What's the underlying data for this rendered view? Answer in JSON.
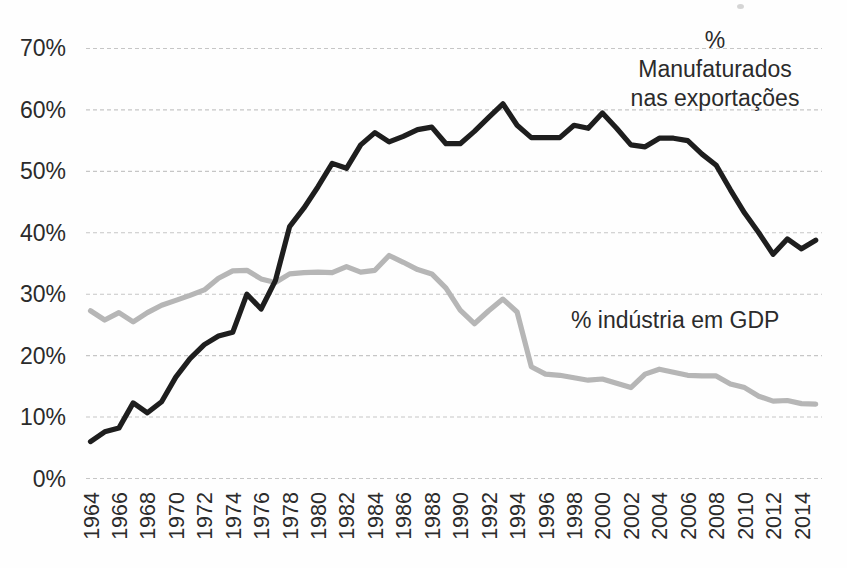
{
  "figure": {
    "background": "#fefefe",
    "grid_color": "#c6c6c6",
    "text_color": "#2b2b2b"
  },
  "chart_data": {
    "type": "line",
    "x": [
      1964,
      1965,
      1966,
      1967,
      1968,
      1969,
      1970,
      1971,
      1972,
      1973,
      1974,
      1975,
      1976,
      1977,
      1978,
      1979,
      1980,
      1981,
      1982,
      1983,
      1984,
      1985,
      1986,
      1987,
      1988,
      1989,
      1990,
      1991,
      1992,
      1993,
      1994,
      1995,
      1996,
      1997,
      1998,
      1999,
      2000,
      2001,
      2002,
      2003,
      2004,
      2005,
      2006,
      2007,
      2008,
      2009,
      2010,
      2011,
      2012,
      2013,
      2014,
      2015
    ],
    "series": [
      {
        "name": "% Manufaturados nas exportações",
        "color": "#1e1e1e",
        "values": [
          6.0,
          7.6,
          8.2,
          12.3,
          10.7,
          12.5,
          16.5,
          19.5,
          21.8,
          23.2,
          23.8,
          30.0,
          27.6,
          32.2,
          41.0,
          44.0,
          47.5,
          51.3,
          50.5,
          54.3,
          56.3,
          54.8,
          55.7,
          56.8,
          57.2,
          54.5,
          54.5,
          56.5,
          58.8,
          61.0,
          57.5,
          55.5,
          55.5,
          55.5,
          57.5,
          57.0,
          59.5,
          57.0,
          54.3,
          54.0,
          55.4,
          55.4,
          55.0,
          52.8,
          51.0,
          47.0,
          43.2,
          40.0,
          36.5,
          39.0,
          37.4,
          38.8
        ]
      },
      {
        "name": "% indústria em GDP",
        "color": "#b6b6b6",
        "values": [
          27.3,
          25.8,
          27.0,
          25.5,
          27.0,
          28.2,
          29.0,
          29.8,
          30.7,
          32.6,
          33.8,
          33.9,
          32.5,
          31.9,
          33.3,
          33.5,
          33.6,
          33.5,
          34.5,
          33.6,
          33.9,
          36.3,
          35.2,
          34.0,
          33.3,
          31.0,
          27.4,
          25.2,
          27.3,
          29.2,
          27.1,
          18.2,
          17.0,
          16.8,
          16.4,
          16.0,
          16.2,
          15.5,
          14.8,
          17.0,
          17.8,
          17.3,
          16.8,
          16.7,
          16.7,
          15.4,
          14.8,
          13.4,
          12.6,
          12.7,
          12.2,
          12.1
        ]
      }
    ],
    "title": "",
    "xlabel": "",
    "ylabel": "",
    "ylim": [
      0,
      70
    ],
    "yticks": [
      0,
      10,
      20,
      30,
      40,
      50,
      60,
      70
    ],
    "ytick_labels": [
      "0%",
      "10%",
      "20%",
      "30%",
      "40%",
      "50%",
      "60%",
      "70%"
    ],
    "xticks": [
      1964,
      1966,
      1968,
      1970,
      1972,
      1974,
      1976,
      1978,
      1980,
      1982,
      1984,
      1986,
      1988,
      1990,
      1992,
      1994,
      1996,
      1998,
      2000,
      2002,
      2004,
      2006,
      2008,
      2010,
      2012,
      2014
    ],
    "grid": "horizontal-dashed",
    "legend_position": "inline-annotations",
    "annotations": {
      "manufactured": {
        "line1": "%",
        "line2": "Manufaturados",
        "line3": "nas exportações"
      },
      "industry": {
        "text": "% indústria em GDP"
      }
    }
  }
}
